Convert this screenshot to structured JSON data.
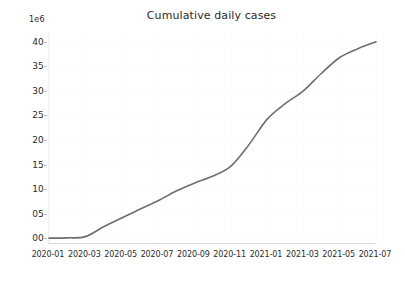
{
  "chart_data": {
    "type": "line",
    "title": "Cumulative daily cases",
    "xlabel": "",
    "ylabel": "",
    "y_offset_text": "1e6",
    "grid": true,
    "legend": null,
    "legend_position": "none",
    "line_color": "#6e6e6e",
    "x_tick_labels": [
      "2020-01",
      "2020-03",
      "2020-05",
      "2020-07",
      "2020-09",
      "2020-11",
      "2021-01",
      "2021-03",
      "2021-05",
      "2021-07"
    ],
    "y_tick_labels": [
      "00",
      "05",
      "10",
      "15",
      "20",
      "25",
      "30",
      "35",
      "40"
    ],
    "y_tick_values": [
      0,
      5,
      10,
      15,
      20,
      25,
      30,
      35,
      40
    ],
    "ylim": [
      -1.2,
      42
    ],
    "xlim": [
      "2020-01",
      "2021-07"
    ],
    "x": [
      "2020-01",
      "2020-02",
      "2020-03",
      "2020-04",
      "2020-05",
      "2020-06",
      "2020-07",
      "2020-08",
      "2020-09",
      "2020-10",
      "2020-11",
      "2020-12",
      "2021-01",
      "2021-02",
      "2021-03",
      "2021-04",
      "2021-05",
      "2021-06",
      "2021-07"
    ],
    "values": [
      0.0,
      0.05,
      0.3,
      2.3,
      4.1,
      5.9,
      7.6,
      9.6,
      11.2,
      12.6,
      14.6,
      19.0,
      24.2,
      27.4,
      30.0,
      33.6,
      36.8,
      38.6,
      40.0
    ],
    "units": "cases (x1e6)",
    "series_name": "Cumulative daily cases"
  }
}
